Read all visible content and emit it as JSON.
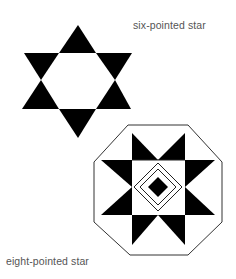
{
  "figure": {
    "labels": {
      "six_pointed": "six-pointed star",
      "eight_pointed": "eight-pointed star"
    },
    "colors": {
      "fill": "#000000",
      "line": "#333333",
      "background": "#ffffff",
      "text": "#555555"
    }
  }
}
